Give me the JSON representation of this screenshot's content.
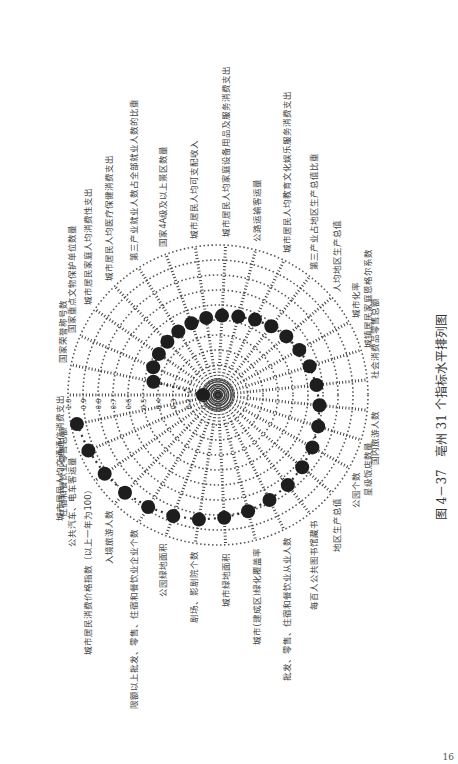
{
  "caption": "图 4－37　亳州 31 个指标水平排列图",
  "page_number": "16",
  "chart_data": {
    "type": "radar",
    "title": "亳州 31 个指标水平排列图",
    "figure_number": "图 4－37",
    "rotation_deg": -90,
    "radial_range": [
      0.0,
      1.0
    ],
    "radial_ticks": [
      "0.0",
      "0.1",
      "0.2",
      "0.3",
      "0.4",
      "0.5",
      "0.6",
      "0.7",
      "0.8",
      "0.9",
      "1.0"
    ],
    "grid": true,
    "legend": null,
    "categories": [
      "城市居民人均交通通信消费支出",
      "国家荣誉称号数",
      "国家重点文物保护单位数量",
      "城市居民家庭人均消费性支出",
      "城市居民人均医疗保健消费支出",
      "第三产业就业人数占全部就业人数的比重",
      "国家4A级及以上景区数量",
      "城市居民人均可支配收入",
      "城市居民人均家庭设备用品及服务消费支出",
      "公路运输客运量",
      "城市居民人均教育文化娱乐服务消费支出",
      "第三产业占地区生产总值比重",
      "人均地区生产总值",
      "城市化率",
      "城镇居民家庭恩格尔系数",
      "社会消费品零售总额",
      "国内旅游人数",
      "星级饭店数量",
      "公园个数",
      "地区生产总值",
      "每百人公共图书馆藏书",
      "批发、零售、住宿和餐饮业从业人数",
      "城市(建成区)绿化覆盖率",
      "城市绿地面积",
      "剧场、影剧院个数",
      "公园绿地面积",
      "限额以上批发、零售、住宿和餐饮业企业个数",
      "入境旅游人数",
      "城市居民消费价格指数（以上一年为100）",
      "公共汽车、电车客运量",
      "住宿和餐饮业零售总额"
    ],
    "series": [
      {
        "name": "亳州",
        "values": [
          0.1,
          0.44,
          0.47,
          0.48,
          0.49,
          0.5,
          0.51,
          0.52,
          0.53,
          0.54,
          0.56,
          0.58,
          0.6,
          0.62,
          0.64,
          0.66,
          0.68,
          0.7,
          0.72,
          0.74,
          0.76,
          0.78,
          0.8,
          0.82,
          0.84,
          0.86,
          0.88,
          0.9,
          0.92,
          0.94,
          0.96
        ]
      }
    ]
  }
}
